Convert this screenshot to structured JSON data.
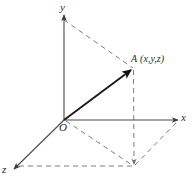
{
  "figure": {
    "background_color": "#ffffff",
    "width": 195,
    "height": 185
  },
  "axes": [
    {
      "id": "y",
      "label": "y",
      "direction": "up",
      "origin": [
        64,
        120
      ],
      "tip": [
        64,
        13
      ],
      "color": "#4a4a4a"
    },
    {
      "id": "x",
      "label": "x",
      "direction": "right",
      "origin": [
        64,
        120
      ],
      "tip": [
        180,
        120
      ],
      "color": "#4a4a4a"
    },
    {
      "id": "z",
      "label": "z",
      "direction": "down-left",
      "origin": [
        64,
        120
      ],
      "tip": [
        12,
        171
      ],
      "color": "#4a4a4a"
    }
  ],
  "origin": {
    "label": "O",
    "position": [
      64,
      120
    ]
  },
  "point": {
    "name": "A",
    "coords_label": "(x,y,z)",
    "position": [
      133,
      68
    ],
    "vector_from_origin": true,
    "vector_color": "#1a1a1a"
  },
  "projection": {
    "xz_plane_point": [
      134,
      166
    ],
    "z_axis_foot": [
      18,
      166
    ],
    "x_axis_foot": [
      178,
      122
    ],
    "y_axis_foot": [
      64,
      20
    ]
  },
  "dashed_color": "#7d7d7d",
  "dashed_segments": [
    {
      "name": "y-axis-to-point",
      "from": [
        64,
        20
      ],
      "to": [
        133,
        68
      ]
    },
    {
      "name": "point-to-xz-projection",
      "from": [
        133,
        68
      ],
      "to": [
        134,
        166
      ]
    },
    {
      "name": "origin-to-xz-projection",
      "from": [
        64,
        120
      ],
      "to": [
        134,
        166
      ]
    },
    {
      "name": "xz-projection-to-x-axis",
      "from": [
        134,
        166
      ],
      "to": [
        178,
        122
      ]
    },
    {
      "name": "xz-projection-to-z-axis",
      "from": [
        134,
        166
      ],
      "to": [
        18,
        166
      ]
    }
  ]
}
